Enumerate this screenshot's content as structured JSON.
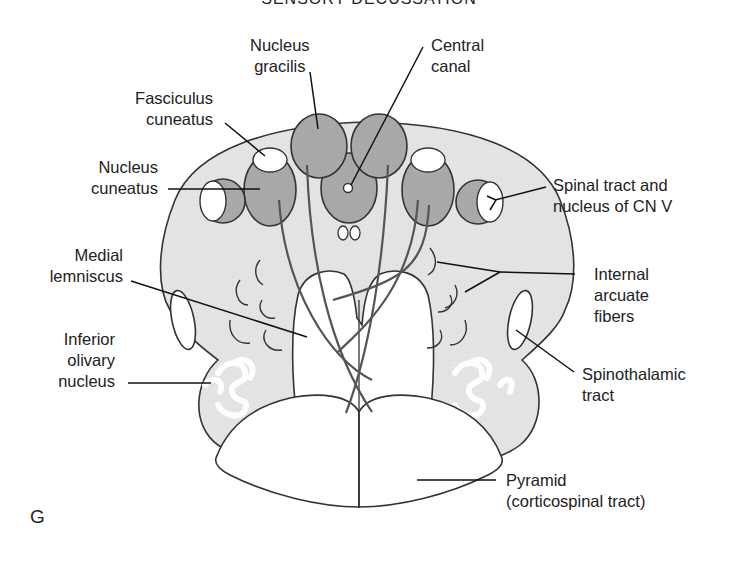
{
  "figure": {
    "title": "SENSORY DECUSSATION",
    "panel_letter": "G",
    "colors": {
      "medulla_fill": "#e4e4e4",
      "nucleus_fill": "#a9a9a9",
      "outline": "#333333",
      "white": "#ffffff"
    }
  },
  "labels": {
    "nucleus_gracilis": [
      "Nucleus",
      "gracilis"
    ],
    "central_canal": [
      "Central",
      "canal"
    ],
    "fasciculus_cuneatus": [
      "Fasciculus",
      "cuneatus"
    ],
    "nucleus_cuneatus": [
      "Nucleus",
      "cuneatus"
    ],
    "spinal_tract_cn_v": [
      "Spinal tract and",
      "nucleus of CN V"
    ],
    "medial_lemniscus": [
      "Medial",
      "lemniscus"
    ],
    "internal_arcuate_fibers": [
      "Internal",
      "arcuate",
      "fibers"
    ],
    "inferior_olivary_nucleus": [
      "Inferior",
      "olivary",
      "nucleus"
    ],
    "spinothalamic_tract": [
      "Spinothalamic",
      "tract"
    ],
    "pyramid": [
      "Pyramid",
      "(corticospinal tract)"
    ]
  }
}
